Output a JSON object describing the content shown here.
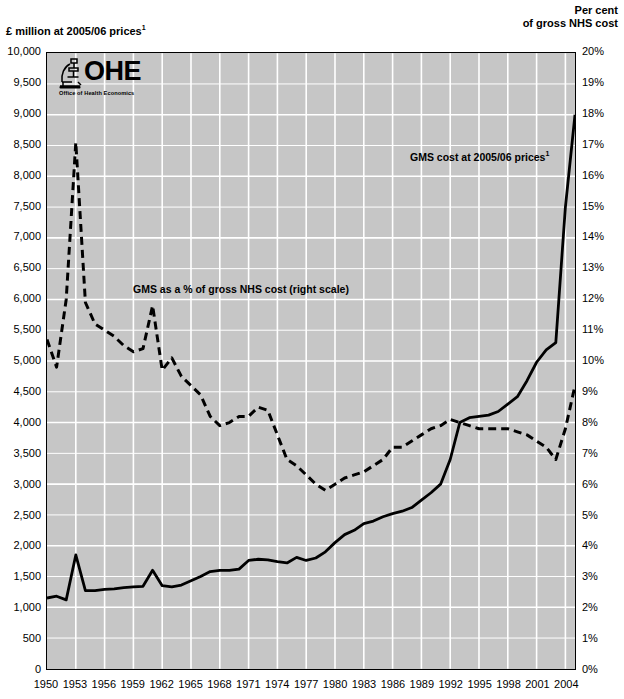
{
  "chart_data": {
    "type": "line",
    "title": "",
    "left_axis": {
      "label": "£ million at 2005/06 prices",
      "label_superscript": "1",
      "ticks": [
        "10,000",
        "9,500",
        "9,000",
        "8,500",
        "8,000",
        "7,500",
        "7,000",
        "6,500",
        "6,000",
        "5,500",
        "5,000",
        "4,500",
        "4,000",
        "3,500",
        "3,000",
        "2,500",
        "2,000",
        "1,500",
        "1,000",
        "500",
        "0"
      ],
      "ylim": [
        0,
        10000
      ],
      "step": 500
    },
    "right_axis": {
      "label_line1": "Per cent",
      "label_line2": "of gross NHS cost",
      "ticks": [
        "20%",
        "19%",
        "18%",
        "17%",
        "16%",
        "15%",
        "14%",
        "13%",
        "12%",
        "11%",
        "10%",
        "9%",
        "8%",
        "7%",
        "6%",
        "5%",
        "4%",
        "3%",
        "2%",
        "1%",
        "0%"
      ],
      "ylim": [
        0,
        20
      ],
      "step": 1
    },
    "xlabel": "",
    "x_tick_labels": [
      "1950",
      "1953",
      "1956",
      "1959",
      "1962",
      "1965",
      "1968",
      "1971",
      "1974",
      "1977",
      "1980",
      "1983",
      "1986",
      "1989",
      "1992",
      "1995",
      "1998",
      "2001",
      "2004"
    ],
    "xlim": [
      1950,
      2005
    ],
    "grid": true,
    "plot_background": "#c6c6c6",
    "gridline_color": "#ffffff",
    "series": [
      {
        "name": "GMS cost at 2005/06 prices",
        "style": "solid",
        "axis": "left",
        "color": "#000000",
        "x": [
          1950,
          1951,
          1952,
          1953,
          1954,
          1955,
          1956,
          1957,
          1958,
          1959,
          1960,
          1961,
          1962,
          1963,
          1964,
          1965,
          1966,
          1967,
          1968,
          1969,
          1970,
          1971,
          1972,
          1973,
          1974,
          1975,
          1976,
          1977,
          1978,
          1979,
          1980,
          1981,
          1982,
          1983,
          1984,
          1985,
          1986,
          1987,
          1988,
          1989,
          1990,
          1991,
          1992,
          1993,
          1994,
          1995,
          1996,
          1997,
          1998,
          1999,
          2000,
          2001,
          2002,
          2003,
          2004,
          2005
        ],
        "values": [
          1150,
          1180,
          1120,
          1850,
          1270,
          1270,
          1290,
          1300,
          1320,
          1330,
          1340,
          1600,
          1350,
          1330,
          1360,
          1430,
          1500,
          1580,
          1600,
          1600,
          1620,
          1760,
          1780,
          1770,
          1740,
          1720,
          1810,
          1760,
          1800,
          1900,
          2050,
          2180,
          2250,
          2360,
          2400,
          2470,
          2520,
          2560,
          2620,
          2740,
          2860,
          3000,
          3400,
          4000,
          4080,
          4100,
          4120,
          4180,
          4300,
          4420,
          4680,
          4980,
          5180,
          5300,
          7500,
          9000
        ]
      },
      {
        "name": "GMS as a % of gross NHS cost (right scale)",
        "style": "dashed",
        "axis": "right",
        "color": "#000000",
        "x": [
          1950,
          1951,
          1952,
          1953,
          1954,
          1955,
          1956,
          1957,
          1958,
          1959,
          1960,
          1961,
          1962,
          1963,
          1964,
          1965,
          1966,
          1967,
          1968,
          1969,
          1970,
          1971,
          1972,
          1973,
          1974,
          1975,
          1976,
          1977,
          1978,
          1979,
          1980,
          1981,
          1982,
          1983,
          1984,
          1985,
          1986,
          1987,
          1988,
          1989,
          1990,
          1991,
          1992,
          1993,
          1994,
          1995,
          1996,
          1997,
          1998,
          1999,
          2000,
          2001,
          2002,
          2003,
          2004,
          2005
        ],
        "values": [
          10.7,
          9.8,
          12.0,
          17.1,
          11.9,
          11.2,
          11.0,
          10.8,
          10.5,
          10.3,
          10.4,
          11.8,
          9.7,
          10.1,
          9.5,
          9.2,
          8.9,
          8.2,
          7.9,
          8.0,
          8.2,
          8.2,
          8.5,
          8.4,
          7.6,
          6.8,
          6.6,
          6.3,
          6.0,
          5.8,
          6.0,
          6.2,
          6.3,
          6.4,
          6.6,
          6.8,
          7.2,
          7.2,
          7.4,
          7.6,
          7.8,
          7.9,
          8.1,
          8.0,
          7.9,
          7.8,
          7.8,
          7.8,
          7.8,
          7.7,
          7.6,
          7.4,
          7.2,
          6.8,
          7.8,
          9.2
        ]
      }
    ],
    "annotations": [
      {
        "text": "GMS cost at 2005/06 prices",
        "superscript": "1",
        "x_px": 410,
        "y_px": 150
      },
      {
        "text": "GMS as a % of gross NHS cost (right scale)",
        "superscript": "",
        "x_px": 133,
        "y_px": 283
      }
    ]
  },
  "logo": {
    "wordmark": "OHE",
    "tagline": "Office of Health Economics",
    "icon": "microscope-icon"
  }
}
